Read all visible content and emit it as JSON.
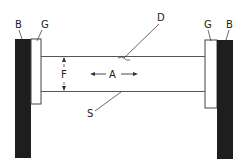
{
  "diagram": {
    "type": "technical-schematic",
    "labels": {
      "left_block": "B",
      "left_gasket": "G",
      "right_gasket": "G",
      "right_block": "B",
      "top_member": "D",
      "bottom_member": "S",
      "gap": "F",
      "axial": "A"
    },
    "colors": {
      "block_fill": "#1e1e1e",
      "line": "#444444",
      "background": "#ffffff"
    }
  }
}
